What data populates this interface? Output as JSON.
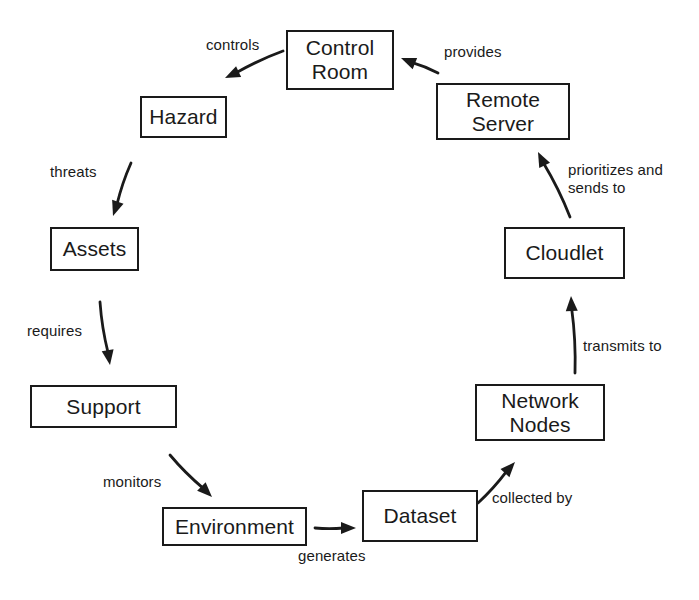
{
  "diagram": {
    "background_color": "#ffffff",
    "stroke_color": "#1a1a1a",
    "nodes": [
      {
        "id": "control-room",
        "label": "Control\nRoom",
        "x": 286,
        "y": 30,
        "w": 108,
        "h": 60
      },
      {
        "id": "hazard",
        "label": "Hazard",
        "x": 140,
        "y": 96,
        "w": 87,
        "h": 42
      },
      {
        "id": "assets",
        "label": "Assets",
        "x": 50,
        "y": 227,
        "w": 89,
        "h": 44
      },
      {
        "id": "support",
        "label": "Support",
        "x": 30,
        "y": 385,
        "w": 147,
        "h": 43
      },
      {
        "id": "environment",
        "label": "Environment",
        "x": 162,
        "y": 507,
        "w": 145,
        "h": 39
      },
      {
        "id": "dataset",
        "label": "Dataset",
        "x": 362,
        "y": 490,
        "w": 116,
        "h": 52
      },
      {
        "id": "network-nodes",
        "label": "Network\nNodes",
        "x": 475,
        "y": 384,
        "w": 130,
        "h": 57
      },
      {
        "id": "cloudlet",
        "label": "Cloudlet",
        "x": 504,
        "y": 227,
        "w": 121,
        "h": 52
      },
      {
        "id": "remote-server",
        "label": "Remote\nServer",
        "x": 436,
        "y": 83,
        "w": 134,
        "h": 57
      }
    ],
    "edges": [
      {
        "id": "control-room-to-hazard",
        "label": "controls",
        "from": "control-room",
        "to": "hazard",
        "label_x": 206,
        "label_y": 36,
        "path": {
          "x1": 283,
          "y1": 51,
          "x2": 225,
          "y2": 78
        }
      },
      {
        "id": "hazard-to-assets",
        "label": "threats",
        "from": "hazard",
        "to": "assets",
        "label_x": 50,
        "label_y": 163,
        "path": {
          "x1": 131,
          "y1": 163,
          "x2": 113,
          "y2": 216
        }
      },
      {
        "id": "assets-to-support",
        "label": "requires",
        "from": "assets",
        "to": "support",
        "label_x": 27,
        "label_y": 322,
        "path": {
          "x1": 100,
          "y1": 302,
          "x2": 110,
          "y2": 365
        }
      },
      {
        "id": "support-to-environment",
        "label": "monitors",
        "from": "support",
        "to": "environment",
        "label_x": 103,
        "label_y": 473,
        "path": {
          "x1": 170,
          "y1": 455,
          "x2": 212,
          "y2": 497
        }
      },
      {
        "id": "environment-to-dataset",
        "label": "generates",
        "from": "environment",
        "to": "dataset",
        "label_x": 298,
        "label_y": 547,
        "path": {
          "x1": 315,
          "y1": 528,
          "x2": 356,
          "y2": 528
        }
      },
      {
        "id": "dataset-to-network-nodes",
        "label": "collected by",
        "from": "dataset",
        "to": "network-nodes",
        "label_x": 492,
        "label_y": 489,
        "path": {
          "x1": 478,
          "y1": 503,
          "x2": 515,
          "y2": 462
        }
      },
      {
        "id": "network-nodes-to-cloudlet",
        "label": "transmits to",
        "from": "network-nodes",
        "to": "cloudlet",
        "label_x": 583,
        "label_y": 337,
        "path": {
          "x1": 575,
          "y1": 373,
          "x2": 571,
          "y2": 296
        }
      },
      {
        "id": "cloudlet-to-remote-server",
        "label": "prioritizes and\nsends to",
        "from": "cloudlet",
        "to": "remote-server",
        "label_x": 568,
        "label_y": 161,
        "path": {
          "x1": 570,
          "y1": 217,
          "x2": 538,
          "y2": 152
        }
      },
      {
        "id": "remote-server-to-control-room",
        "label": "provides",
        "from": "remote-server",
        "to": "control-room",
        "label_x": 444,
        "label_y": 43,
        "path": {
          "x1": 438,
          "y1": 73,
          "x2": 401,
          "y2": 58
        }
      }
    ]
  }
}
